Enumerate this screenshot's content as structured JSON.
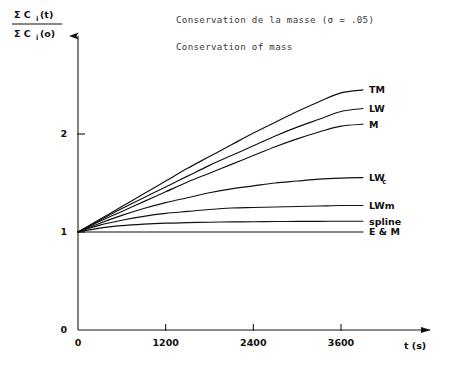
{
  "figure": {
    "title_fr": "Conservation de la masse (σ = .05)",
    "title_en": "Conservation of mass",
    "ylabel_numerator": "Σ C",
    "ylabel_numerator_sub": "i",
    "ylabel_numerator_arg": "(t)",
    "ylabel_denominator": "Σ C",
    "ylabel_denominator_sub": "i",
    "ylabel_denominator_arg": "(o)",
    "xlabel": "t (s)"
  },
  "chart_data": {
    "type": "line",
    "xlabel": "t (s)",
    "ylabel": "Σ Ci(t) / Σ Ci(o)",
    "xlim": [
      0,
      4000
    ],
    "ylim": [
      0,
      2.6
    ],
    "xticks": [
      0,
      1200,
      2400,
      3600
    ],
    "xticklabels": [
      "0",
      "1200",
      "2400",
      "3600"
    ],
    "yticks": [
      0,
      1,
      2
    ],
    "yticklabels": [
      "0",
      "1",
      "2"
    ],
    "grid": false,
    "legend": "right-inline-labels",
    "x": [
      0,
      300,
      600,
      900,
      1200,
      1500,
      1800,
      2100,
      2400,
      2700,
      3000,
      3300,
      3600,
      3900
    ],
    "series": [
      {
        "name": "TM",
        "label": "TM",
        "values": [
          1.0,
          1.13,
          1.26,
          1.39,
          1.52,
          1.65,
          1.77,
          1.89,
          2.01,
          2.12,
          2.23,
          2.33,
          2.42,
          2.45
        ]
      },
      {
        "name": "LW",
        "label": "LW",
        "values": [
          1.0,
          1.12,
          1.24,
          1.35,
          1.46,
          1.57,
          1.68,
          1.78,
          1.88,
          1.98,
          2.07,
          2.15,
          2.23,
          2.26
        ]
      },
      {
        "name": "M",
        "label": "M",
        "values": [
          1.0,
          1.11,
          1.21,
          1.31,
          1.41,
          1.51,
          1.6,
          1.69,
          1.78,
          1.87,
          1.95,
          2.02,
          2.08,
          2.1
        ]
      },
      {
        "name": "LWc",
        "label": "LW",
        "label_sub": "c",
        "values": [
          1.0,
          1.09,
          1.17,
          1.24,
          1.3,
          1.35,
          1.4,
          1.44,
          1.47,
          1.5,
          1.52,
          1.54,
          1.55,
          1.555
        ]
      },
      {
        "name": "LWm",
        "label": "LWm",
        "values": [
          1.0,
          1.07,
          1.12,
          1.16,
          1.19,
          1.21,
          1.23,
          1.245,
          1.25,
          1.255,
          1.26,
          1.265,
          1.27,
          1.27
        ]
      },
      {
        "name": "spline",
        "label": "spline",
        "values": [
          1.0,
          1.04,
          1.065,
          1.08,
          1.09,
          1.095,
          1.1,
          1.103,
          1.105,
          1.107,
          1.108,
          1.109,
          1.11,
          1.11
        ]
      },
      {
        "name": "E_and_M",
        "label": "E & M",
        "values": [
          1.0,
          1.0,
          1.0,
          1.0,
          1.0,
          1.0,
          1.0,
          1.0,
          1.0,
          1.0,
          1.0,
          1.0,
          1.0,
          1.0
        ]
      }
    ]
  }
}
